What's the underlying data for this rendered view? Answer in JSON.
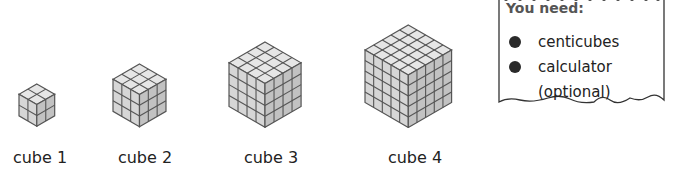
{
  "cubes": [
    {
      "label": "cube 1",
      "n": 2,
      "left": 18,
      "bottom": 126,
      "edge": 24
    },
    {
      "label": "cube 2",
      "n": 3,
      "left": 112,
      "bottom": 127,
      "edge": 64
    },
    {
      "label": "cube 3",
      "n": 4,
      "left": 228,
      "bottom": 127,
      "edge": 84
    },
    {
      "label": "cube 4",
      "n": 5,
      "left": 364,
      "bottom": 127,
      "edge": 106
    }
  ],
  "labels": {
    "cube1": "cube 1",
    "cube2": "cube 2",
    "cube3": "cube 3",
    "cube4": "cube 4"
  },
  "note": {
    "title": "You need:",
    "items": [
      "centicubes",
      "calculator"
    ],
    "item2_sub": "(optional)"
  },
  "colors": {
    "top": "#e6e6e6",
    "left": "#d6d6d6",
    "right": "#c2c2c2",
    "grid": "#555555",
    "bullet": "#2a2a2a"
  }
}
